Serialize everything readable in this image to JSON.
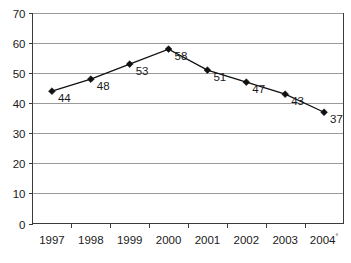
{
  "chart_data": {
    "type": "line",
    "title": "",
    "subtitle": "",
    "xlabel": "",
    "ylabel": "",
    "categories": [
      "1997",
      "1998",
      "1999",
      "2000",
      "2001",
      "2002",
      "2003",
      "2004"
    ],
    "category_superscripts": [
      "",
      "",
      "",
      "",
      "",
      "",
      "",
      "°"
    ],
    "values": [
      44,
      48,
      53,
      58,
      51,
      47,
      43,
      37
    ],
    "point_labels": [
      "44",
      "48",
      "53",
      "58",
      "51",
      "47",
      "43",
      "37"
    ],
    "ylim": [
      0,
      70
    ],
    "ytick_step": 10,
    "yticks": [
      "0",
      "10",
      "20",
      "30",
      "40",
      "50",
      "60",
      "70"
    ],
    "grid": "horizontal",
    "legend": "none",
    "marker": "diamond",
    "series": [
      {
        "name": "",
        "values": [
          44,
          48,
          53,
          58,
          51,
          47,
          43,
          37
        ]
      }
    ],
    "colors": {
      "line": "#111111",
      "marker": "#111111",
      "gridline": "#9a9a9a",
      "axis": "#3b3b3b",
      "text": "#1a1a1a",
      "background": "#ffffff"
    }
  }
}
